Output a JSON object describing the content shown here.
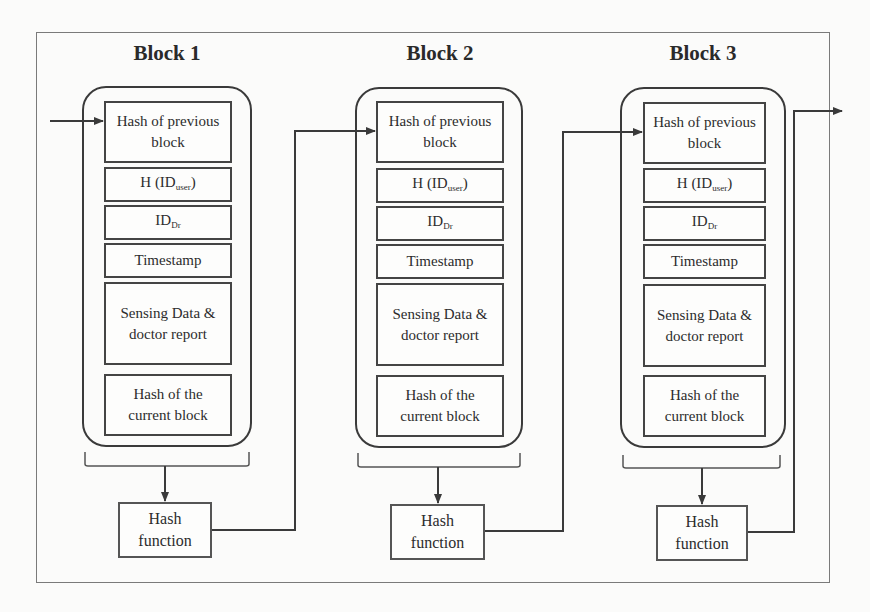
{
  "diagram": {
    "type": "blockchain-structure",
    "blocks": [
      {
        "title": "Block 1",
        "fields": {
          "prev_hash": "Hash of previous block",
          "h_id_user_main": "H (ID",
          "h_id_user_sub": "user",
          "h_id_user_close": ")",
          "id_dr_main": "ID",
          "id_dr_sub": "Dr",
          "timestamp": "Timestamp",
          "sensing": "Sensing Data & doctor report",
          "current_hash": "Hash of the current block"
        },
        "hash_function": "Hash function"
      },
      {
        "title": "Block 2",
        "fields": {
          "prev_hash": "Hash of previous block",
          "h_id_user_main": "H (ID",
          "h_id_user_sub": "user",
          "h_id_user_close": ")",
          "id_dr_main": "ID",
          "id_dr_sub": "Dr",
          "timestamp": "Timestamp",
          "sensing": "Sensing Data & doctor report",
          "current_hash": "Hash of the current block"
        },
        "hash_function": "Hash function"
      },
      {
        "title": "Block 3",
        "fields": {
          "prev_hash": "Hash of previous block",
          "h_id_user_main": "H (ID",
          "h_id_user_sub": "user",
          "h_id_user_close": ")",
          "id_dr_main": "ID",
          "id_dr_sub": "Dr",
          "timestamp": "Timestamp",
          "sensing": "Sensing Data & doctor report",
          "current_hash": "Hash of the current block"
        },
        "hash_function": "Hash function"
      }
    ],
    "colors": {
      "line": "#3a3a3a",
      "frame": "#7a7a7a",
      "background": "#fbfbfa"
    }
  }
}
